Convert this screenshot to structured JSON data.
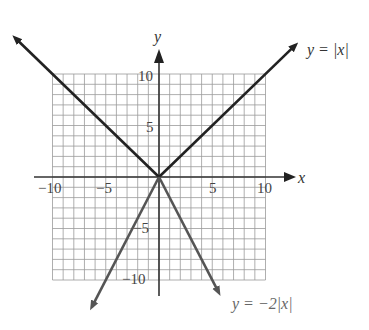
{
  "chart_data": {
    "type": "line",
    "title": "",
    "xlabel": "x",
    "ylabel": "y",
    "xlim": [
      -10,
      10
    ],
    "ylim": [
      -10,
      10
    ],
    "grid": true,
    "grid_step": 1,
    "x_ticks": [
      -10,
      -5,
      5,
      10
    ],
    "y_ticks": [
      -10,
      -5,
      5,
      10
    ],
    "x_tick_labels": [
      "−10",
      "−5",
      "5",
      "10"
    ],
    "y_tick_labels": [
      "−10",
      "−5",
      "5",
      "10"
    ],
    "series": [
      {
        "name": "y = |x|",
        "function": "abs(x)",
        "points": [
          [
            -13.5,
            13.5
          ],
          [
            0,
            0
          ],
          [
            12.8,
            12.8
          ]
        ],
        "color": "#222222"
      },
      {
        "name": "y = −2|x|",
        "function": "-2*abs(x)",
        "points": [
          [
            -6.3,
            -12.6
          ],
          [
            0,
            0
          ],
          [
            5.6,
            -11.2
          ]
        ],
        "color": "#555555"
      }
    ],
    "annotations": [
      {
        "text": "y = |x|",
        "near": "upper-right end of y=|x|"
      },
      {
        "text": "y = −2|x|",
        "near": "lower-right end of y=-2|x|"
      }
    ]
  },
  "labels": {
    "x_axis": "x",
    "y_axis": "y",
    "series1": "y = |x|",
    "series2": "y = −2|x|",
    "tick_x_m10": "−10",
    "tick_x_m5": "−5",
    "tick_x_5": "5",
    "tick_x_10": "10",
    "tick_y_10": "10",
    "tick_y_5": "5",
    "tick_y_m5": "−5",
    "tick_y_m10": "−10"
  }
}
